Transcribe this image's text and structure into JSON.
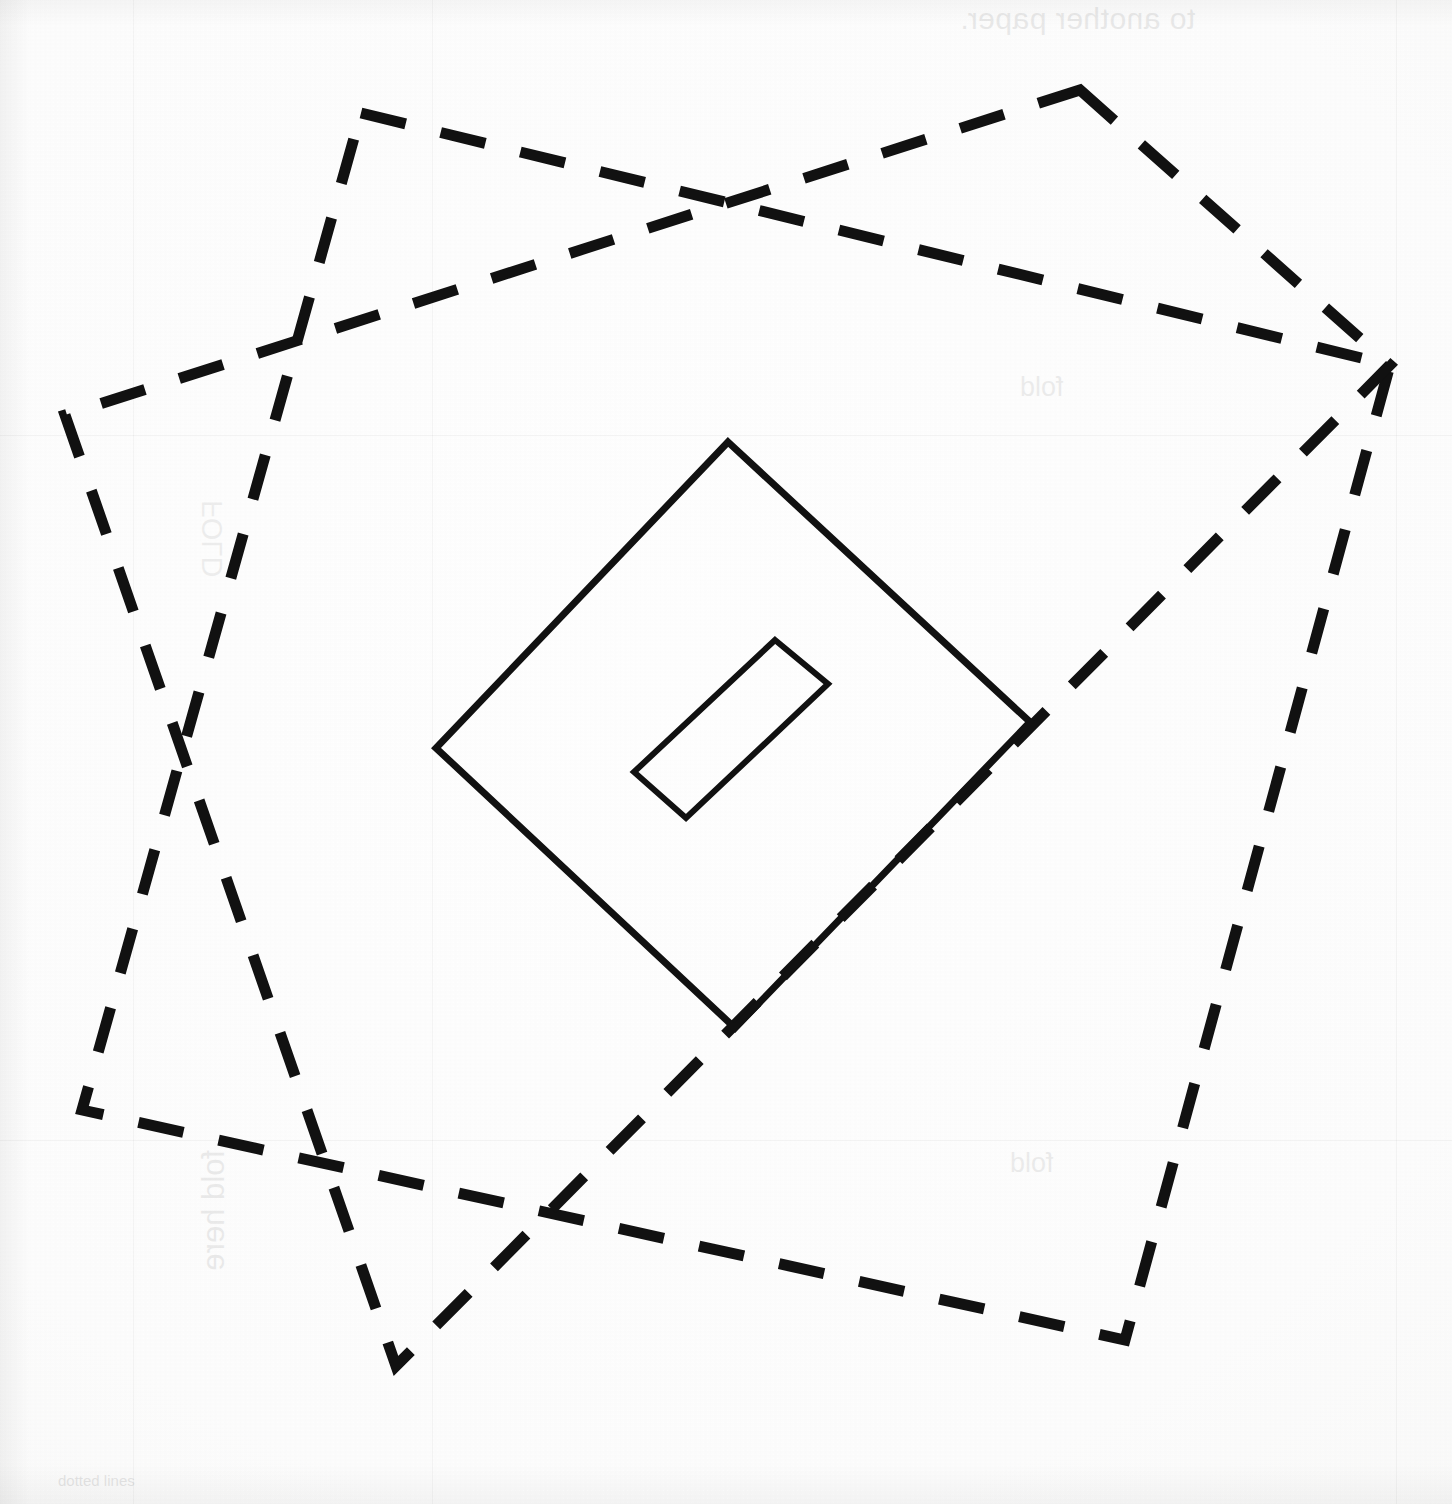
{
  "document": {
    "title": "Paper folding construction diagram",
    "media": "scanned hand/printed drawing on white paper",
    "canvas": {
      "width": 1452,
      "height": 1504
    },
    "ink_color": "#111111",
    "paper_color": "#fdfdfc"
  },
  "showthrough_text": {
    "note": "mirrored text bleeding through from the reverse side of the sheet",
    "another_paper": "to another paper.",
    "fold_top": "fold",
    "fold_bottom": "fold",
    "left_upper": "FOLD",
    "left_lower": "fold here",
    "bottom_note": "dotted lines"
  },
  "shapes": {
    "dashed_outline": {
      "name": "dashed-square-outline",
      "style": "dashed",
      "stroke_width": 11,
      "dash": "44 34",
      "color": "#111111",
      "description": "large square rotated about 45 degrees (diamond), drawn with long dashes",
      "vertices": [
        {
          "label": "top-left",
          "x": 361,
          "y": 113
        },
        {
          "label": "top-right",
          "x": 1080,
          "y": 90
        },
        {
          "label": "right",
          "x": 1390,
          "y": 365
        },
        {
          "label": "bottom-right",
          "x": 1125,
          "y": 1340
        },
        {
          "label": "bottom-left",
          "x": 396,
          "y": 1366
        },
        {
          "label": "left",
          "x": 65,
          "y": 415
        },
        {
          "label": "left-lower",
          "x": 82,
          "y": 1110
        }
      ]
    },
    "dashed_square_a": {
      "name": "dashed-square-northwest-southeast",
      "corners": [
        {
          "x": 361,
          "y": 113
        },
        {
          "x": 1390,
          "y": 365
        },
        {
          "x": 1125,
          "y": 1340
        },
        {
          "x": 82,
          "y": 1110
        }
      ]
    },
    "dashed_square_b": {
      "name": "dashed-square-northeast-southwest",
      "corners": [
        {
          "x": 1080,
          "y": 90
        },
        {
          "x": 1390,
          "y": 365
        },
        {
          "x": 396,
          "y": 1366
        },
        {
          "x": 65,
          "y": 415
        }
      ]
    },
    "solid_diamond": {
      "name": "solid-diamond",
      "style": "solid",
      "stroke_width": 7,
      "color": "#111111",
      "description": "central square rotated 45 degrees, solid outline",
      "vertices": [
        {
          "label": "top",
          "x": 728,
          "y": 442
        },
        {
          "label": "right",
          "x": 1030,
          "y": 722
        },
        {
          "label": "bottom",
          "x": 735,
          "y": 1028
        },
        {
          "label": "left",
          "x": 436,
          "y": 748
        }
      ]
    },
    "inner_rectangle": {
      "name": "inner-rectangle",
      "style": "solid",
      "stroke_width": 6,
      "color": "#111111",
      "description": "small rectangle tilted about -43 degrees, inside the solid diamond",
      "vertices": [
        {
          "label": "top-right",
          "x": 775,
          "y": 640
        },
        {
          "label": "right",
          "x": 828,
          "y": 684
        },
        {
          "label": "bottom-left",
          "x": 686,
          "y": 818
        },
        {
          "label": "left",
          "x": 634,
          "y": 772
        }
      ]
    }
  },
  "guides": {
    "description": "very faint ruled guide lines bleeding through the sheet",
    "horizontal_y": [
      435,
      1140
    ],
    "vertical_x": [
      133,
      432,
      1396
    ]
  }
}
